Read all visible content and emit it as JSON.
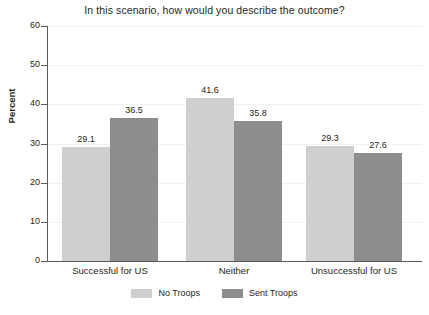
{
  "chart_data": {
    "type": "bar",
    "title": "In this scenario, how would you describe the outcome?",
    "xlabel": "",
    "ylabel": "Percent",
    "ylim": [
      0,
      60
    ],
    "yticks": [
      0,
      10,
      20,
      30,
      40,
      50,
      60
    ],
    "grid": true,
    "legend_position": "bottom",
    "categories": [
      "Successful for US",
      "Neither",
      "Unsuccessful for US"
    ],
    "series": [
      {
        "name": "No Troops",
        "color": "#cfcfcf",
        "values": [
          29.1,
          41.6,
          29.3
        ],
        "labels": [
          "29.1",
          "41.6",
          "29.3"
        ]
      },
      {
        "name": "Sent Troops",
        "color": "#8d8d8d",
        "values": [
          36.5,
          35.8,
          27.6
        ],
        "labels": [
          "36.5",
          "35.8",
          "27.6"
        ]
      }
    ],
    "tick_labels": [
      "0",
      "10",
      "20",
      "30",
      "40",
      "50",
      "60"
    ]
  },
  "legend": {
    "items": [
      {
        "label": "No Troops"
      },
      {
        "label": "Sent Troops"
      }
    ]
  }
}
